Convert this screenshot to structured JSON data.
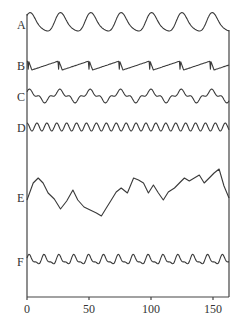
{
  "chart_data": {
    "type": "line",
    "title": "",
    "xlabel": "",
    "ylabel": "",
    "xlim": [
      0,
      163
    ],
    "x_ticks": [
      0,
      50,
      100,
      150
    ],
    "x_tick_labels": [
      "0",
      "50",
      "100",
      "150"
    ],
    "grid": false,
    "legend": "none (traces labeled at left edge)",
    "series": [
      {
        "name": "A",
        "shape": "periodic, ~7 cycles, rounded peaks",
        "period": 24.5,
        "baseline_y": 23,
        "amplitude": 9,
        "peaks_x": [
          3,
          24,
          48,
          73,
          98,
          123,
          147
        ]
      },
      {
        "name": "B",
        "shape": "sawtooth, slow rise then sharp drop",
        "period": 24.5,
        "baseline_y": 65,
        "amplitude": 5,
        "drops_x": [
          0,
          24,
          49,
          74,
          98,
          123,
          147
        ]
      },
      {
        "name": "C",
        "shape": "periodic with secondary bumps",
        "period": 24.5,
        "baseline_y": 96,
        "amplitude": 6
      },
      {
        "name": "D",
        "shape": "fast regular sinusoid, ~20 cycles",
        "period": 8,
        "baseline_y": 127,
        "amplitude": 4
      },
      {
        "name": "E",
        "shape": "irregular noisy signal",
        "baseline_y": 196,
        "amplitude": 20,
        "points": [
          [
            0,
            200
          ],
          [
            5,
            183
          ],
          [
            9,
            178
          ],
          [
            13,
            183
          ],
          [
            17,
            193
          ],
          [
            22,
            199
          ],
          [
            27,
            209
          ],
          [
            32,
            201
          ],
          [
            37,
            190
          ],
          [
            41,
            200
          ],
          [
            46,
            207
          ],
          [
            51,
            210
          ],
          [
            56,
            213
          ],
          [
            60,
            216
          ],
          [
            64,
            208
          ],
          [
            68,
            200
          ],
          [
            72,
            192
          ],
          [
            76,
            188
          ],
          [
            81,
            193
          ],
          [
            86,
            178
          ],
          [
            90,
            180
          ],
          [
            94,
            183
          ],
          [
            98,
            193
          ],
          [
            102,
            185
          ],
          [
            106,
            193
          ],
          [
            110,
            200
          ],
          [
            114,
            192
          ],
          [
            119,
            188
          ],
          [
            123,
            183
          ],
          [
            127,
            178
          ],
          [
            131,
            181
          ],
          [
            135,
            178
          ],
          [
            139,
            175
          ],
          [
            143,
            183
          ],
          [
            147,
            178
          ],
          [
            151,
            173
          ],
          [
            155,
            169
          ],
          [
            159,
            186
          ],
          [
            163,
            198
          ]
        ]
      },
      {
        "name": "F",
        "shape": "periodic with irregular peaks",
        "period": 12,
        "baseline_y": 260,
        "amplitude": 5
      }
    ]
  },
  "labels": {
    "A": "A",
    "B": "B",
    "C": "C",
    "D": "D",
    "E": "E",
    "F": "F"
  },
  "ticks": {
    "t0": "0",
    "t50": "50",
    "t100": "100",
    "t150": "150"
  }
}
